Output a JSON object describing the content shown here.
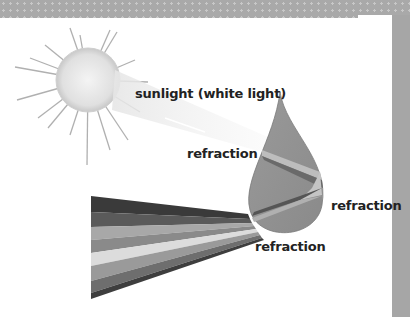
{
  "diagram": {
    "labels": {
      "sunlight": "sunlight (white light)",
      "refraction_entry": "refraction",
      "refraction_back": "refraction",
      "refraction_exit": "refraction"
    },
    "elements": [
      "sun",
      "light-ray",
      "raindrop",
      "spectrum-fan"
    ],
    "spectrum_bands": [
      "#3a3a3a",
      "#5a5a5a",
      "#a8a8a8",
      "#8a8a8a",
      "#dcdcdc",
      "#9a9a9a",
      "#6e6e6e",
      "#3e3e3e"
    ]
  }
}
